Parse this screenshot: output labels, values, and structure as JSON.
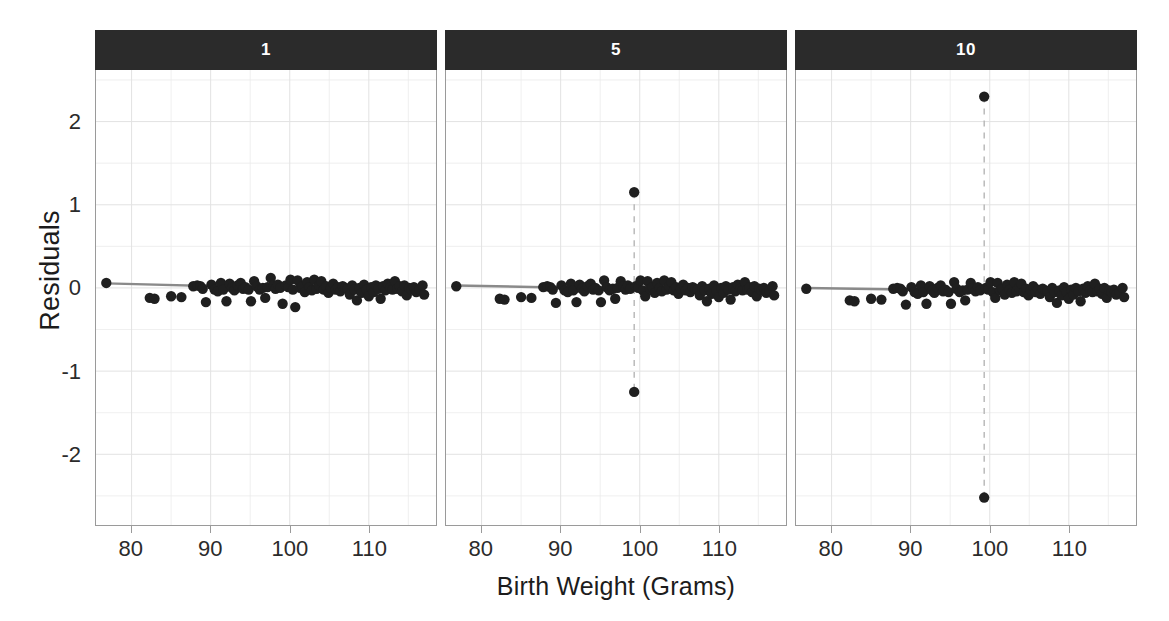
{
  "chart_data": {
    "type": "scatter",
    "title": "",
    "xlabel": "Birth Weight (Grams)",
    "ylabel": "Residuals",
    "xlim": [
      75.5,
      118.5
    ],
    "ylim": [
      -2.85,
      2.62
    ],
    "xticks": [
      80,
      90,
      100,
      110
    ],
    "yticks": [
      2,
      1,
      0,
      -1,
      -2
    ],
    "xticklabels": [
      "80",
      "90",
      "100",
      "110"
    ],
    "yticklabels": [
      "2",
      "1",
      "0",
      "-1",
      "-2"
    ],
    "grid": true,
    "legend": false,
    "facet_variable": "",
    "panels": [
      {
        "strip_label": "1",
        "fit_line": {
          "x": [
            76.8,
            117.0
          ],
          "y": [
            0.055,
            -0.045
          ]
        },
        "outlier_line": null,
        "points": [
          [
            76.8,
            0.06
          ],
          [
            82.3,
            -0.12
          ],
          [
            82.9,
            -0.13
          ],
          [
            85.0,
            -0.1
          ],
          [
            86.3,
            -0.11
          ],
          [
            87.8,
            0.02
          ],
          [
            88.3,
            0.03
          ],
          [
            88.7,
            0.02
          ],
          [
            89.0,
            -0.01
          ],
          [
            89.4,
            -0.17
          ],
          [
            90.1,
            0.04
          ],
          [
            90.5,
            -0.02
          ],
          [
            90.9,
            -0.04
          ],
          [
            91.3,
            0.06
          ],
          [
            91.6,
            -0.02
          ],
          [
            92.0,
            -0.16
          ],
          [
            92.4,
            0.05
          ],
          [
            92.7,
            0.0
          ],
          [
            93.0,
            -0.03
          ],
          [
            93.4,
            0.03
          ],
          [
            93.8,
            0.06
          ],
          [
            94.1,
            -0.01
          ],
          [
            94.4,
            0.01
          ],
          [
            94.8,
            -0.02
          ],
          [
            95.1,
            -0.16
          ],
          [
            95.5,
            0.08
          ],
          [
            95.8,
            0.02
          ],
          [
            96.2,
            -0.02
          ],
          [
            96.6,
            0.0
          ],
          [
            96.9,
            -0.12
          ],
          [
            97.2,
            0.01
          ],
          [
            97.6,
            0.12
          ],
          [
            97.9,
            0.03
          ],
          [
            98.2,
            -0.01
          ],
          [
            98.5,
            0.04
          ],
          [
            98.8,
            0.0
          ],
          [
            99.1,
            -0.19
          ],
          [
            99.5,
            0.03
          ],
          [
            99.8,
            0.01
          ],
          [
            100.1,
            0.1
          ],
          [
            100.4,
            -0.02
          ],
          [
            100.7,
            -0.23
          ],
          [
            101.0,
            0.09
          ],
          [
            101.3,
            0.0
          ],
          [
            101.6,
            0.02
          ],
          [
            101.9,
            -0.05
          ],
          [
            102.2,
            0.07
          ],
          [
            102.5,
            0.01
          ],
          [
            102.8,
            -0.03
          ],
          [
            103.1,
            0.1
          ],
          [
            103.4,
            -0.01
          ],
          [
            103.7,
            0.03
          ],
          [
            104.0,
            0.08
          ],
          [
            104.3,
            -0.02
          ],
          [
            104.6,
            0.02
          ],
          [
            104.9,
            -0.06
          ],
          [
            105.2,
            0.0
          ],
          [
            105.5,
            0.05
          ],
          [
            105.8,
            -0.02
          ],
          [
            106.1,
            0.01
          ],
          [
            106.4,
            -0.04
          ],
          [
            106.7,
            0.02
          ],
          [
            107.0,
            0.0
          ],
          [
            107.3,
            -0.01
          ],
          [
            107.6,
            -0.08
          ],
          [
            107.9,
            0.03
          ],
          [
            108.2,
            -0.02
          ],
          [
            108.5,
            -0.15
          ],
          [
            108.8,
            0.0
          ],
          [
            109.1,
            -0.06
          ],
          [
            109.4,
            0.04
          ],
          [
            109.7,
            -0.02
          ],
          [
            110.0,
            -0.1
          ],
          [
            110.3,
            0.01
          ],
          [
            110.6,
            -0.05
          ],
          [
            110.9,
            0.03
          ],
          [
            111.2,
            -0.01
          ],
          [
            111.5,
            -0.13
          ],
          [
            111.8,
            0.02
          ],
          [
            112.1,
            -0.03
          ],
          [
            112.4,
            0.05
          ],
          [
            112.7,
            0.0
          ],
          [
            113.0,
            -0.02
          ],
          [
            113.3,
            0.08
          ],
          [
            113.6,
            -0.01
          ],
          [
            113.9,
            0.02
          ],
          [
            114.2,
            -0.04
          ],
          [
            114.5,
            0.03
          ],
          [
            114.8,
            -0.09
          ],
          [
            115.1,
            0.0
          ],
          [
            115.4,
            -0.02
          ],
          [
            115.7,
            0.01
          ],
          [
            116.0,
            -0.05
          ],
          [
            116.4,
            -0.02
          ],
          [
            116.8,
            0.03
          ],
          [
            117.0,
            -0.08
          ]
        ]
      },
      {
        "strip_label": "5",
        "fit_line": {
          "x": [
            76.8,
            117.0
          ],
          "y": [
            0.03,
            -0.05
          ]
        },
        "outlier_line": {
          "x": 99.3,
          "y_top": 1.15,
          "y_bottom": -1.25
        },
        "points": [
          [
            76.8,
            0.02
          ],
          [
            82.3,
            -0.13
          ],
          [
            82.9,
            -0.14
          ],
          [
            85.0,
            -0.11
          ],
          [
            86.3,
            -0.12
          ],
          [
            87.8,
            0.01
          ],
          [
            88.3,
            0.02
          ],
          [
            88.7,
            0.01
          ],
          [
            89.0,
            -0.02
          ],
          [
            89.4,
            -0.18
          ],
          [
            90.1,
            0.03
          ],
          [
            90.5,
            -0.03
          ],
          [
            90.9,
            -0.05
          ],
          [
            91.3,
            0.05
          ],
          [
            91.6,
            -0.03
          ],
          [
            92.0,
            -0.17
          ],
          [
            92.4,
            0.04
          ],
          [
            92.7,
            -0.01
          ],
          [
            93.0,
            -0.04
          ],
          [
            93.4,
            0.02
          ],
          [
            93.8,
            0.05
          ],
          [
            94.1,
            -0.02
          ],
          [
            94.4,
            0.0
          ],
          [
            94.8,
            -0.03
          ],
          [
            95.1,
            -0.17
          ],
          [
            95.5,
            0.09
          ],
          [
            95.8,
            0.01
          ],
          [
            96.2,
            -0.03
          ],
          [
            96.6,
            -0.01
          ],
          [
            96.9,
            -0.13
          ],
          [
            97.2,
            0.0
          ],
          [
            97.6,
            0.08
          ],
          [
            97.9,
            0.02
          ],
          [
            98.2,
            -0.02
          ],
          [
            98.5,
            0.03
          ],
          [
            98.8,
            -0.01
          ],
          [
            99.3,
            1.15
          ],
          [
            99.3,
            -1.25
          ],
          [
            99.5,
            0.02
          ],
          [
            99.8,
            0.0
          ],
          [
            100.1,
            0.09
          ],
          [
            100.4,
            -0.03
          ],
          [
            100.7,
            -0.1
          ],
          [
            101.0,
            0.08
          ],
          [
            101.3,
            -0.01
          ],
          [
            101.6,
            0.01
          ],
          [
            101.9,
            -0.06
          ],
          [
            102.2,
            0.06
          ],
          [
            102.5,
            0.0
          ],
          [
            102.8,
            -0.04
          ],
          [
            103.1,
            0.09
          ],
          [
            103.4,
            -0.02
          ],
          [
            103.7,
            0.02
          ],
          [
            104.0,
            0.07
          ],
          [
            104.3,
            -0.03
          ],
          [
            104.6,
            0.01
          ],
          [
            104.9,
            -0.07
          ],
          [
            105.2,
            -0.01
          ],
          [
            105.5,
            0.04
          ],
          [
            105.8,
            -0.03
          ],
          [
            106.1,
            0.0
          ],
          [
            106.4,
            -0.05
          ],
          [
            106.7,
            0.01
          ],
          [
            107.0,
            -0.01
          ],
          [
            107.3,
            -0.02
          ],
          [
            107.6,
            -0.09
          ],
          [
            107.9,
            0.02
          ],
          [
            108.2,
            -0.03
          ],
          [
            108.5,
            -0.16
          ],
          [
            108.8,
            -0.01
          ],
          [
            109.1,
            -0.07
          ],
          [
            109.4,
            0.03
          ],
          [
            109.7,
            -0.03
          ],
          [
            110.0,
            -0.11
          ],
          [
            110.3,
            0.0
          ],
          [
            110.6,
            -0.06
          ],
          [
            110.9,
            0.02
          ],
          [
            111.2,
            -0.02
          ],
          [
            111.5,
            -0.14
          ],
          [
            111.8,
            0.01
          ],
          [
            112.1,
            -0.04
          ],
          [
            112.4,
            0.04
          ],
          [
            112.7,
            -0.01
          ],
          [
            113.0,
            -0.03
          ],
          [
            113.3,
            0.07
          ],
          [
            113.6,
            -0.02
          ],
          [
            113.9,
            0.01
          ],
          [
            114.2,
            -0.05
          ],
          [
            114.5,
            0.02
          ],
          [
            114.8,
            -0.1
          ],
          [
            115.1,
            -0.01
          ],
          [
            115.4,
            -0.03
          ],
          [
            115.7,
            0.0
          ],
          [
            116.0,
            -0.06
          ],
          [
            116.4,
            -0.03
          ],
          [
            116.8,
            0.02
          ],
          [
            117.0,
            -0.09
          ]
        ]
      },
      {
        "strip_label": "10",
        "fit_line": {
          "x": [
            76.8,
            117.0
          ],
          "y": [
            0.0,
            -0.06
          ]
        },
        "outlier_line": {
          "x": 99.3,
          "y_top": 2.3,
          "y_bottom": -2.52
        },
        "points": [
          [
            76.8,
            -0.01
          ],
          [
            82.3,
            -0.15
          ],
          [
            82.9,
            -0.16
          ],
          [
            85.0,
            -0.13
          ],
          [
            86.3,
            -0.14
          ],
          [
            87.8,
            -0.01
          ],
          [
            88.3,
            0.0
          ],
          [
            88.7,
            -0.01
          ],
          [
            89.0,
            -0.04
          ],
          [
            89.4,
            -0.2
          ],
          [
            90.1,
            0.01
          ],
          [
            90.5,
            -0.05
          ],
          [
            90.9,
            -0.07
          ],
          [
            91.3,
            0.03
          ],
          [
            91.6,
            -0.05
          ],
          [
            92.0,
            -0.19
          ],
          [
            92.4,
            0.02
          ],
          [
            92.7,
            -0.03
          ],
          [
            93.0,
            -0.06
          ],
          [
            93.4,
            0.0
          ],
          [
            93.8,
            0.03
          ],
          [
            94.1,
            -0.04
          ],
          [
            94.4,
            -0.02
          ],
          [
            94.8,
            -0.05
          ],
          [
            95.1,
            -0.19
          ],
          [
            95.5,
            0.07
          ],
          [
            95.8,
            -0.01
          ],
          [
            96.2,
            -0.05
          ],
          [
            96.6,
            -0.03
          ],
          [
            96.9,
            -0.15
          ],
          [
            97.2,
            -0.02
          ],
          [
            97.6,
            0.06
          ],
          [
            97.9,
            0.0
          ],
          [
            98.2,
            -0.04
          ],
          [
            98.5,
            0.01
          ],
          [
            98.8,
            -0.03
          ],
          [
            99.3,
            2.3
          ],
          [
            99.3,
            -2.52
          ],
          [
            99.5,
            0.0
          ],
          [
            99.8,
            -0.02
          ],
          [
            100.1,
            0.07
          ],
          [
            100.4,
            -0.05
          ],
          [
            100.7,
            -0.12
          ],
          [
            101.0,
            0.06
          ],
          [
            101.3,
            -0.03
          ],
          [
            101.6,
            -0.01
          ],
          [
            101.9,
            -0.08
          ],
          [
            102.2,
            0.04
          ],
          [
            102.5,
            -0.02
          ],
          [
            102.8,
            -0.06
          ],
          [
            103.1,
            0.07
          ],
          [
            103.4,
            -0.04
          ],
          [
            103.7,
            0.0
          ],
          [
            104.0,
            0.05
          ],
          [
            104.3,
            -0.05
          ],
          [
            104.6,
            -0.01
          ],
          [
            104.9,
            -0.09
          ],
          [
            105.2,
            -0.03
          ],
          [
            105.5,
            0.02
          ],
          [
            105.8,
            -0.05
          ],
          [
            106.1,
            -0.02
          ],
          [
            106.4,
            -0.07
          ],
          [
            106.7,
            -0.01
          ],
          [
            107.0,
            -0.03
          ],
          [
            107.3,
            -0.04
          ],
          [
            107.6,
            -0.11
          ],
          [
            107.9,
            0.0
          ],
          [
            108.2,
            -0.05
          ],
          [
            108.5,
            -0.18
          ],
          [
            108.8,
            -0.03
          ],
          [
            109.1,
            -0.09
          ],
          [
            109.4,
            0.01
          ],
          [
            109.7,
            -0.05
          ],
          [
            110.0,
            -0.13
          ],
          [
            110.3,
            -0.02
          ],
          [
            110.6,
            -0.08
          ],
          [
            110.9,
            0.0
          ],
          [
            111.2,
            -0.04
          ],
          [
            111.5,
            -0.16
          ],
          [
            111.8,
            -0.01
          ],
          [
            112.1,
            -0.06
          ],
          [
            112.4,
            0.02
          ],
          [
            112.7,
            -0.03
          ],
          [
            113.0,
            -0.05
          ],
          [
            113.3,
            0.05
          ],
          [
            113.6,
            -0.04
          ],
          [
            113.9,
            -0.01
          ],
          [
            114.2,
            -0.07
          ],
          [
            114.5,
            0.0
          ],
          [
            114.8,
            -0.12
          ],
          [
            115.1,
            -0.03
          ],
          [
            115.4,
            -0.05
          ],
          [
            115.7,
            -0.02
          ],
          [
            116.0,
            -0.08
          ],
          [
            116.4,
            -0.05
          ],
          [
            116.8,
            0.0
          ],
          [
            117.0,
            -0.11
          ]
        ]
      }
    ],
    "style": {
      "point_color": "#1f1f1f",
      "point_radius": 5.2,
      "fit_line_color": "#8a8a8a",
      "outlier_line_color": "#b5b5b5",
      "grid_color": "#ebebeb",
      "axis_color": "#9a9a9a",
      "strip_bg": "#2b2b2b",
      "strip_fg": "#ffffff",
      "background": "#ffffff"
    }
  },
  "layout": {
    "panel_left": [
      95,
      445,
      795
    ],
    "panel_width": 342,
    "panel_top": 30,
    "strip_height": 40,
    "plot_height": 456
  }
}
